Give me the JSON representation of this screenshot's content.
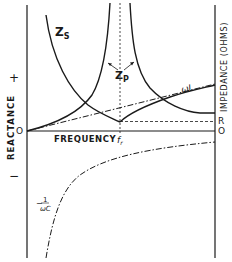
{
  "diagram": {
    "type": "impedance-reactance-vs-frequency",
    "axes": {
      "x_label": "FREQUENCY",
      "left_label": "REACTANCE",
      "right_label": "IMPEDANCE (OHMS)",
      "left_plus": "+",
      "left_minus": "−",
      "left_zero": "O",
      "right_zero": "O",
      "right_R": "R",
      "resonance_label": "f",
      "resonance_sub": "r"
    },
    "curves": {
      "series_label_main": "Z",
      "series_label_sub": "S",
      "parallel_label_main": "Z",
      "parallel_label_sub": "P",
      "inductive_label": "ωL",
      "capacitive_label_prefix": "−",
      "capacitive_label_num": "1",
      "capacitive_label_den": "ωC"
    },
    "colors": {
      "ink": "#1a1a1a",
      "background": "#ffffff"
    }
  }
}
